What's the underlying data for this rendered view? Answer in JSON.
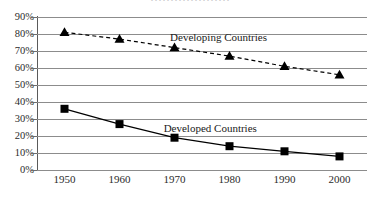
{
  "chart_data": {
    "type": "line",
    "title": "",
    "xlabel": "",
    "ylabel": "",
    "grid": "horizontal",
    "legend_position": "inline-labels",
    "categories": [
      1950,
      1960,
      1970,
      1980,
      1990,
      2000
    ],
    "x_tick_labels": [
      "1950",
      "1960",
      "1970",
      "1980",
      "1990",
      "2000"
    ],
    "y_tick_labels": [
      "90%",
      "80%",
      "70%",
      "60%",
      "50%",
      "40%",
      "30%",
      "20%",
      "10%",
      "0%"
    ],
    "y_tick_values": [
      90,
      80,
      70,
      60,
      50,
      40,
      30,
      20,
      10,
      0
    ],
    "ylim": [
      0,
      90
    ],
    "xlim": [
      1945,
      2005
    ],
    "series": [
      {
        "name": "Developing Countries",
        "values": [
          81,
          77,
          72,
          67,
          61,
          56
        ],
        "line_style": "dashed",
        "marker": "triangle",
        "color": "#000000",
        "label_x": 1978,
        "label_y": 78
      },
      {
        "name": "Developed Countries",
        "values": [
          36,
          27,
          19,
          14,
          11,
          8
        ],
        "line_style": "solid",
        "marker": "square",
        "color": "#000000",
        "label_x": 1976.5,
        "label_y": 25
      }
    ]
  },
  "axis": {
    "y_labels": [
      "90%",
      "80%",
      "70%",
      "60%",
      "50%",
      "40%",
      "30%",
      "20%",
      "10%",
      "0%"
    ],
    "x_labels": [
      "1950",
      "1960",
      "1970",
      "1980",
      "1990",
      "2000"
    ]
  },
  "labels": {
    "developing": "Developing Countries",
    "developed": "Developed Countries"
  },
  "colors": {
    "series_developing": "#000000",
    "series_developed": "#000000",
    "gridline": "#8c8c8c",
    "axis": "#5a5a5a",
    "text": "#1a1a1a",
    "background": "#ffffff"
  },
  "top_crop": {
    "text": "····················"
  }
}
